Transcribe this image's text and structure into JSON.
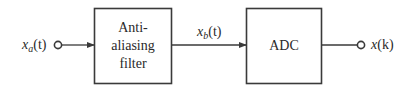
{
  "diagram": {
    "type": "block-diagram",
    "input": {
      "symbol": "x",
      "subscript": "a",
      "arg": "(t)"
    },
    "blocks": [
      {
        "id": "anti-aliasing-filter",
        "lines": [
          "Anti-",
          "aliasing",
          "filter"
        ]
      },
      {
        "id": "adc",
        "lines": [
          "ADC"
        ]
      }
    ],
    "intermediate_signal": {
      "symbol": "x",
      "subscript": "b",
      "arg": "(t)"
    },
    "output": {
      "symbol": "x",
      "arg": "(k)"
    },
    "colors": {
      "stroke": "#3a3a3a",
      "text": "#2a2a2a",
      "background": "#ffffff"
    }
  }
}
